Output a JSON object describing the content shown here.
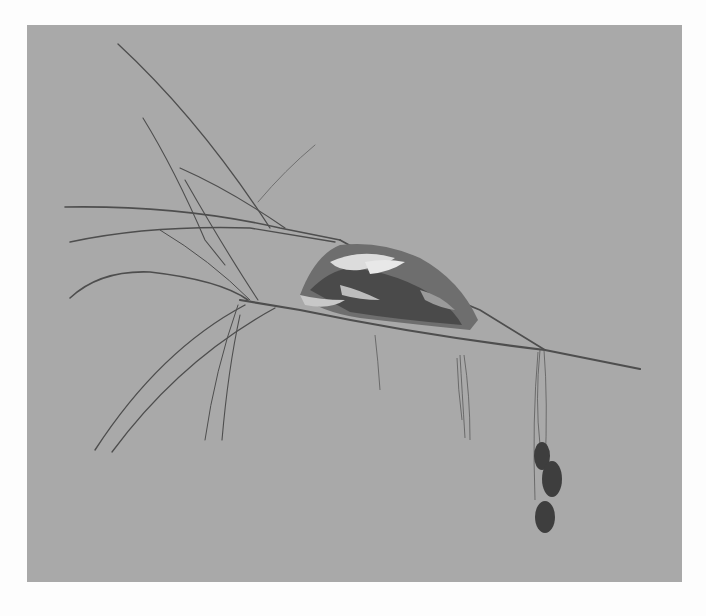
{
  "image": {
    "subject": "bird nest on a thin branch",
    "background_color": "#a9a9a9",
    "page_color": "#fdfdfd",
    "twig_color": "#4a4a4a",
    "nest_colors": [
      "#3a3a3a",
      "#6b6b6b",
      "#d9d9d9"
    ],
    "leaf_color": "#3c3c3c"
  }
}
